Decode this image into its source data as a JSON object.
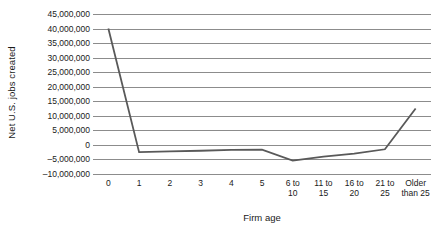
{
  "chart_data": {
    "type": "line",
    "title": "",
    "xlabel": "Firm age",
    "ylabel": "Net U.S. jobs created",
    "categories": [
      "0",
      "1",
      "2",
      "3",
      "4",
      "5",
      "6 to\n10",
      "11 to\n15",
      "16 to\n20",
      "21 to\n25",
      "Older\nthan 25"
    ],
    "category_labels": [
      {
        "line1": "0",
        "line2": ""
      },
      {
        "line1": "1",
        "line2": ""
      },
      {
        "line1": "2",
        "line2": ""
      },
      {
        "line1": "3",
        "line2": ""
      },
      {
        "line1": "4",
        "line2": ""
      },
      {
        "line1": "5",
        "line2": ""
      },
      {
        "line1": "6 to",
        "line2": "10"
      },
      {
        "line1": "11 to",
        "line2": "15"
      },
      {
        "line1": "16 to",
        "line2": "20"
      },
      {
        "line1": "21 to",
        "line2": "25"
      },
      {
        "line1": "Older",
        "line2": "than 25"
      }
    ],
    "values": [
      40000000,
      -2500000,
      -2200000,
      -2000000,
      -1700000,
      -1600000,
      -5400000,
      -4000000,
      -3000000,
      -1500000,
      12500000
    ],
    "ylim": [
      -10000000,
      45000000
    ],
    "ytick_values": [
      45000000,
      40000000,
      35000000,
      30000000,
      25000000,
      20000000,
      15000000,
      10000000,
      5000000,
      0,
      -5000000,
      -10000000
    ],
    "ytick_labels": [
      "45,000,000",
      "40,000,000",
      "35,000,000",
      "30,000,000",
      "25,000,000",
      "20,000,000",
      "15,000,000",
      "10,000,000",
      "5,000,000",
      "0",
      "–5,000,000",
      "–10,000,000"
    ],
    "grid": true,
    "legend": false,
    "legend_position": "none",
    "series_color": "#595959",
    "gridline_color": "#8c8c8c",
    "background_color": "#ffffff"
  }
}
